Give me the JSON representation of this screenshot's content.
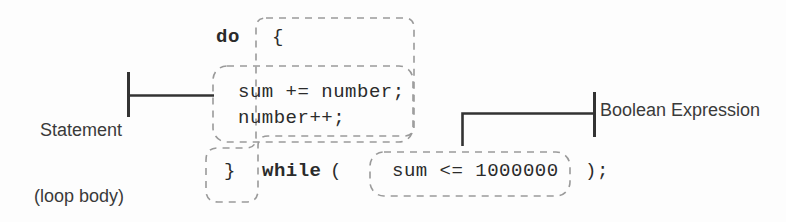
{
  "figure": {
    "type": "code-annotation-diagram",
    "background_color": "#fdfdfd",
    "code_color": "#2b2b2b",
    "label_color": "#3a3a3a",
    "dash_color": "#9a9a9a",
    "connector_color": "#333333"
  },
  "code": {
    "do_keyword": "do",
    "open_brace": "{",
    "statement_1": "sum += number;",
    "statement_2": "number++;",
    "close_brace": "}",
    "while_keyword": "while",
    "left_paren": "(",
    "condition": "sum <= 1000000",
    "right_paren": ");"
  },
  "annotations": {
    "statement_label_line1": "Statement",
    "statement_label_line2": "(loop body)",
    "boolean_label": "Boolean Expression"
  }
}
